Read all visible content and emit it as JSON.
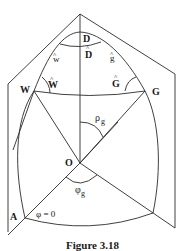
{
  "figure": {
    "caption": "Figure 3.18",
    "labels": {
      "D": "D",
      "D_hat": "D",
      "w_hat": "w",
      "g_hat": "g",
      "W": "W",
      "W_hat": "W",
      "G": "G",
      "G_hat": "G",
      "rho": "ρ",
      "rho_sub": "g",
      "O": "O",
      "phi": "φ",
      "phi_sub": "g",
      "A": "A",
      "phi_zero": "φ = 0"
    },
    "hat_glyph": "^"
  }
}
